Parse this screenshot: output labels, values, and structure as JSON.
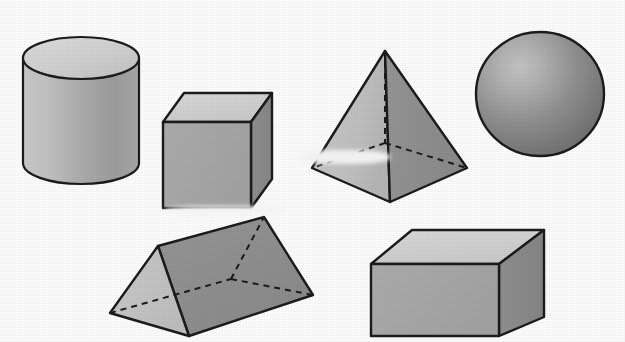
{
  "figure": {
    "width": 625,
    "height": 342,
    "background_color": "#fdfdfd",
    "stroke_color": "#1c1c1c",
    "hidden_edge_style": "dashed"
  },
  "palette": {
    "outline": "#1c1c1c",
    "face_light": "#d2d2d2",
    "face_light_alt": "#c7c7c7",
    "face_mid": "#a8a8a8",
    "face_dark": "#8c8c8c",
    "face_darker": "#7d7d7d",
    "sphere_highlight": "#bdbdbd",
    "sphere_shadow": "#6d6d6d",
    "cylinder_body_light": "#c9c9c9",
    "cylinder_body_dark": "#9a9a9a"
  },
  "shapes": [
    {
      "id": "cylinder",
      "name": "cylinder",
      "label": "Cylinder",
      "position": "top-left",
      "faces": [
        "top-ellipse",
        "lateral-surface"
      ],
      "top_face_color": "#d2d2d2",
      "body_color": "#aeaeae",
      "geometry": {
        "center_x": 81,
        "top_center_y": 58,
        "bottom_center_y": 163,
        "radius_x": 58,
        "radius_y": 21
      }
    },
    {
      "id": "cube",
      "name": "cube",
      "label": "Cube",
      "position": "top-center-left",
      "faces": [
        "top",
        "front",
        "right"
      ],
      "top_face_color": "#d2d2d2",
      "front_face_color": "#a8a8a8",
      "right_face_color": "#8c8c8c",
      "geometry": {
        "front_top_left": [
          163,
          122
        ],
        "front_top_right": [
          251,
          122
        ],
        "front_bottom_left": [
          163,
          208
        ],
        "front_bottom_right": [
          251,
          208
        ],
        "back_top_left": [
          184,
          93
        ],
        "back_top_right": [
          272,
          93
        ],
        "back_bottom_right": [
          272,
          179
        ]
      }
    },
    {
      "id": "pyramid",
      "name": "square-pyramid",
      "label": "Square pyramid",
      "position": "top-center-right",
      "faces": [
        "left-front",
        "right-front"
      ],
      "left_face_color": "#c4c4c4",
      "right_face_color": "#909090",
      "hidden_edges": [
        "apex-to-back-base",
        "back-base-to-left",
        "back-base-to-right"
      ],
      "geometry": {
        "apex": [
          385,
          51
        ],
        "base_left": [
          312,
          168
        ],
        "base_front": [
          390,
          202
        ],
        "base_right": [
          467,
          168
        ],
        "base_back_hidden": [
          385,
          143
        ]
      }
    },
    {
      "id": "sphere",
      "name": "sphere",
      "label": "Sphere",
      "position": "top-right",
      "faces": [
        "surface"
      ],
      "highlight_color": "#bdbdbd",
      "shadow_color": "#6d6d6d",
      "geometry": {
        "center_x": 540,
        "center_y": 94,
        "radius_x": 64,
        "radius_y": 62,
        "highlight_x": 512,
        "highlight_y": 66
      }
    },
    {
      "id": "triangular-prism",
      "name": "triangular-prism",
      "label": "Triangular prism",
      "position": "bottom-left",
      "faces": [
        "left-triangle",
        "front-bottom",
        "top-back"
      ],
      "left_face_color": "#c5c5c5",
      "front_face_color": "#c5c5c5",
      "top_face_color": "#8e8e8e",
      "hidden_edges": [
        "back-vertex-to-left",
        "back-vertex-to-right",
        "back-vertex-to-ridge"
      ],
      "geometry": {
        "ridge_near": [
          158,
          246
        ],
        "ridge_far": [
          264,
          217
        ],
        "base_left": [
          110,
          313
        ],
        "base_front": [
          189,
          336
        ],
        "base_right": [
          313,
          295
        ],
        "base_back_hidden": [
          231,
          279
        ]
      }
    },
    {
      "id": "rectangular-prism",
      "name": "rectangular-prism",
      "label": "Rectangular prism",
      "position": "bottom-right",
      "faces": [
        "top",
        "front",
        "right"
      ],
      "top_face_color": "#d2d2d2",
      "front_face_color": "#a8a8a8",
      "right_face_color": "#8c8c8c",
      "geometry": {
        "front_top_left": [
          371,
          264
        ],
        "front_top_right": [
          499,
          264
        ],
        "front_bottom_left": [
          371,
          336
        ],
        "front_bottom_right": [
          499,
          336
        ],
        "back_top_left": [
          412,
          230
        ],
        "back_top_right": [
          544,
          230
        ],
        "back_bottom_right": [
          544,
          317
        ]
      }
    }
  ]
}
